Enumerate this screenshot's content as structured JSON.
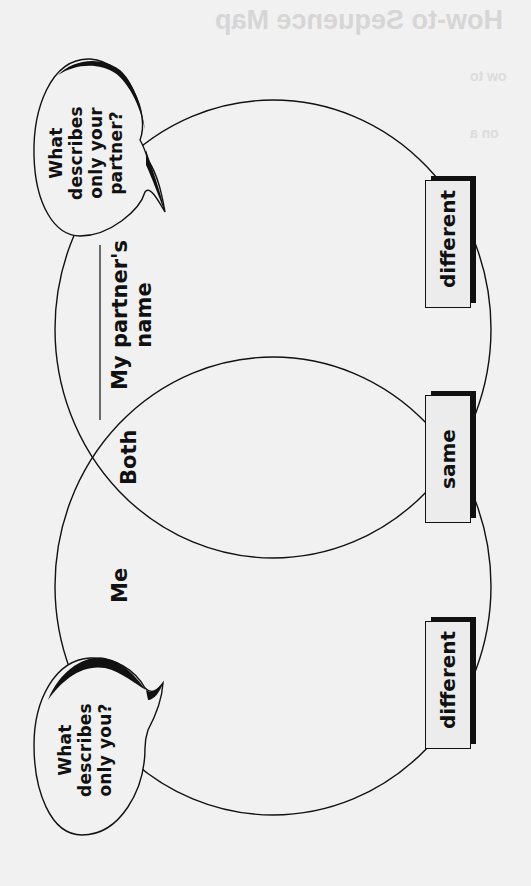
{
  "background_bleed": {
    "title": "How-to Sequence Map",
    "line1": "ow to",
    "line2": "on a"
  },
  "diagram": {
    "orientation": "rotated-90-ccw",
    "circles": [
      {
        "id": "partner",
        "label": "My partner's name",
        "label_line1": "My partner's",
        "label_line2": "name"
      },
      {
        "id": "me",
        "label": "Me"
      }
    ],
    "overlap_label": "Both",
    "bubbles": {
      "partner": {
        "line1": "What",
        "line2": "describes",
        "line3": "only your",
        "line4": "partner?"
      },
      "me": {
        "line1": "What",
        "line2": "describes",
        "line3": "only you?"
      }
    },
    "boxes": {
      "partner_only": "different",
      "overlap": "same",
      "me_only": "different"
    },
    "colors": {
      "background": "#f1f1f1",
      "ink": "#111111",
      "box_fill": "#ececec"
    }
  }
}
